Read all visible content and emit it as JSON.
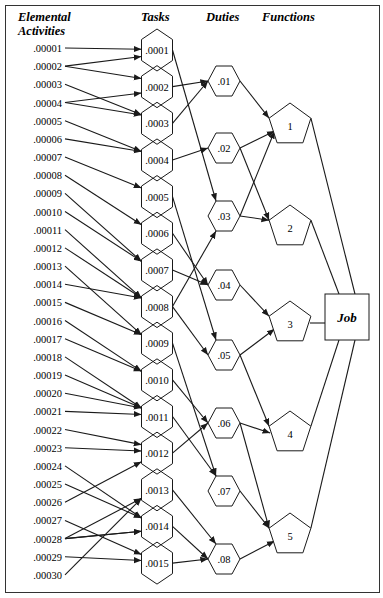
{
  "headers": {
    "elemental_line1": "Elemental",
    "elemental_line2": "Activities",
    "tasks": "Tasks",
    "duties": "Duties",
    "functions": "Functions"
  },
  "job_label": "Job",
  "elemental_activities": [
    ".00001",
    ".00002",
    ".00003",
    ".00004",
    ".00005",
    ".00006",
    ".00007",
    ".00008",
    ".00009",
    ".00010",
    ".00011",
    ".00012",
    ".00013",
    ".00014",
    ".00015",
    ".00016",
    ".00017",
    ".00018",
    ".00019",
    ".00020",
    ".00021",
    ".00022",
    ".00023",
    ".00024",
    ".00025",
    ".00026",
    ".00027",
    ".00028",
    ".00029",
    ".00030"
  ],
  "tasks": [
    ".0001",
    ".0002",
    ".0003",
    ".0004",
    ".0005",
    ".0006",
    ".0007",
    ".0008",
    ".0009",
    ".0010",
    ".0011",
    ".0012",
    ".0013",
    ".0014",
    ".0015"
  ],
  "duties": [
    ".01",
    ".02",
    ".03",
    ".04",
    ".05",
    ".06",
    ".07",
    ".08"
  ],
  "functions": [
    "1",
    "2",
    "3",
    "4",
    "5"
  ],
  "edges": {
    "activity_to_task": [
      [
        0,
        0
      ],
      [
        1,
        0
      ],
      [
        1,
        1
      ],
      [
        2,
        2
      ],
      [
        3,
        1
      ],
      [
        3,
        2
      ],
      [
        4,
        3
      ],
      [
        5,
        3
      ],
      [
        6,
        4
      ],
      [
        7,
        5
      ],
      [
        8,
        6
      ],
      [
        9,
        6
      ],
      [
        10,
        7
      ],
      [
        11,
        7
      ],
      [
        12,
        8
      ],
      [
        13,
        7
      ],
      [
        14,
        8
      ],
      [
        15,
        9
      ],
      [
        16,
        9
      ],
      [
        17,
        10
      ],
      [
        18,
        10
      ],
      [
        19,
        10
      ],
      [
        20,
        10
      ],
      [
        21,
        11
      ],
      [
        22,
        11
      ],
      [
        23,
        13
      ],
      [
        24,
        13
      ],
      [
        25,
        11
      ],
      [
        26,
        14
      ],
      [
        27,
        12
      ],
      [
        27,
        13
      ],
      [
        27,
        13
      ],
      [
        28,
        14
      ],
      [
        29,
        12
      ]
    ],
    "task_to_duty": [
      [
        0,
        2
      ],
      [
        1,
        0
      ],
      [
        2,
        0
      ],
      [
        3,
        1
      ],
      [
        4,
        4
      ],
      [
        5,
        3
      ],
      [
        6,
        3
      ],
      [
        7,
        2
      ],
      [
        7,
        4
      ],
      [
        8,
        6
      ],
      [
        9,
        5
      ],
      [
        10,
        6
      ],
      [
        11,
        5
      ],
      [
        12,
        7
      ],
      [
        13,
        7
      ],
      [
        14,
        7
      ]
    ],
    "duty_to_function": [
      [
        0,
        0
      ],
      [
        1,
        0
      ],
      [
        1,
        1
      ],
      [
        2,
        0
      ],
      [
        2,
        1
      ],
      [
        3,
        2
      ],
      [
        4,
        2
      ],
      [
        4,
        3
      ],
      [
        5,
        3
      ],
      [
        5,
        4
      ],
      [
        6,
        4
      ],
      [
        7,
        4
      ]
    ],
    "function_to_job": [
      0,
      1,
      2,
      3,
      4
    ]
  }
}
